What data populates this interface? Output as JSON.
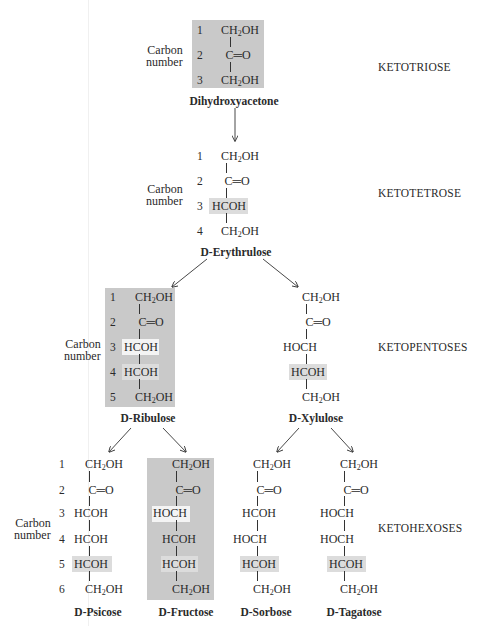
{
  "diagram": {
    "carbon_label": [
      "Carbon",
      "number"
    ],
    "categories": {
      "ketotriose": "KETOTRIOSE",
      "ketotetrose": "KETOTETROSE",
      "ketopentoses": "KETOPENTOSES",
      "ketohexoses": "KETOHEXOSES"
    },
    "colors": {
      "box_dark": "#c9c9c9",
      "highlight_light": "#dcdcdc",
      "highlight_white": "#f4f4f4",
      "text": "#2a2a2a"
    },
    "molecules": {
      "dihydroxyacetone": {
        "name": "Dihydroxyacetone",
        "carbons": [
          "1",
          "2",
          "3"
        ],
        "groups": [
          "CH2OH",
          "C=O",
          "CH2OH"
        ]
      },
      "erythrulose": {
        "name_prefix": "D",
        "name": "-Erythrulose",
        "carbons": [
          "1",
          "2",
          "3",
          "4"
        ],
        "groups": [
          "CH2OH",
          "C=O",
          "HCOH",
          "CH2OH"
        ],
        "highlighted_row": 3
      },
      "ribulose": {
        "name_prefix": "D",
        "name": "-Ribulose",
        "carbons": [
          "1",
          "2",
          "3",
          "4",
          "5"
        ],
        "groups": [
          "CH2OH",
          "C=O",
          "HCOH",
          "HCOH",
          "CH2OH"
        ]
      },
      "xylulose": {
        "name_prefix": "D",
        "name": "-Xylulose",
        "groups": [
          "CH2OH",
          "C=O",
          "HOCH",
          "HCOH",
          "CH2OH"
        ],
        "highlighted_row": 4
      },
      "psicose": {
        "name_prefix": "D",
        "name": "-Psicose",
        "carbons": [
          "1",
          "2",
          "3",
          "4",
          "5",
          "6"
        ],
        "groups": [
          "CH2OH",
          "C=O",
          "HCOH",
          "HCOH",
          "HCOH",
          "CH2OH"
        ],
        "highlighted_row": 5
      },
      "fructose": {
        "name_prefix": "D",
        "name": "-Fructose",
        "groups": [
          "CH2OH",
          "C=O",
          "HOCH",
          "HCOH",
          "HCOH",
          "CH2OH"
        ]
      },
      "sorbose": {
        "name_prefix": "D",
        "name": "-Sorbose",
        "groups": [
          "CH2OH",
          "C=O",
          "HCOH",
          "HOCH",
          "HCOH",
          "CH2OH"
        ],
        "highlighted_row": 5
      },
      "tagatose": {
        "name_prefix": "D",
        "name": "-Tagatose",
        "groups": [
          "CH2OH",
          "C=O",
          "HOCH",
          "HOCH",
          "HCOH",
          "CH2OH"
        ],
        "highlighted_row": 5
      }
    }
  }
}
